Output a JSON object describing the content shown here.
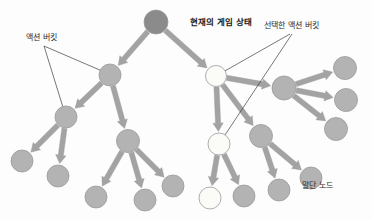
{
  "diagram": {
    "title_label": "현재의 게임 상태",
    "type": "tree",
    "canvas": {
      "width": 372,
      "height": 220,
      "background": "#fdfdfd"
    },
    "colors": {
      "root_node_fill": "#8b8b8b",
      "gray_node_fill": "#b3b3b3",
      "white_node_fill": "#fbfbf7",
      "node_stroke": "#9a9a9a",
      "edge_arrow": "#a3a3a3",
      "leader_line": "#3d3d3d",
      "label_text": "#2b2b2b"
    },
    "annotations": [
      {
        "id": "current-game-state",
        "text": "현재의 게임 상태",
        "x": 190,
        "y": 18,
        "bold": true,
        "leaders": []
      },
      {
        "id": "action-bucket",
        "text": "액션 버킷",
        "x": 26,
        "y": 34,
        "bold": false,
        "leaders": [
          {
            "x1": 44,
            "y1": 46,
            "x2": 109,
            "y2": 74
          },
          {
            "x1": 44,
            "y1": 46,
            "x2": 66,
            "y2": 117
          }
        ]
      },
      {
        "id": "selected-action-bucket",
        "text": "선택한 액션 버킷",
        "x": 264,
        "y": 22,
        "bold": false,
        "leaders": [
          {
            "x1": 290,
            "y1": 34,
            "x2": 216,
            "y2": 76
          },
          {
            "x1": 292,
            "y1": 34,
            "x2": 219,
            "y2": 144
          }
        ]
      },
      {
        "id": "leaf-node",
        "text": "말단 노드",
        "x": 302,
        "y": 182,
        "bold": false,
        "leaders": []
      }
    ],
    "nodes": [
      {
        "id": "root",
        "x": 156,
        "y": 22,
        "r": 12,
        "fill": "root",
        "name": "root-node-current-state"
      },
      {
        "id": "l1",
        "x": 110,
        "y": 75,
        "r": 11,
        "fill": "gray",
        "name": "tree-node-gray"
      },
      {
        "id": "r1",
        "x": 216,
        "y": 76,
        "r": 10.5,
        "fill": "white",
        "name": "tree-node-selected"
      },
      {
        "id": "l2a",
        "x": 66,
        "y": 117,
        "r": 11,
        "fill": "gray",
        "name": "tree-node-gray"
      },
      {
        "id": "l2b",
        "x": 128,
        "y": 141,
        "r": 11.5,
        "fill": "gray",
        "name": "tree-node-gray"
      },
      {
        "id": "r2a",
        "x": 219,
        "y": 144,
        "r": 11,
        "fill": "white",
        "name": "tree-node-selected"
      },
      {
        "id": "r2b",
        "x": 261,
        "y": 136,
        "r": 11.5,
        "fill": "gray",
        "name": "tree-node-gray"
      },
      {
        "id": "r1b",
        "x": 284,
        "y": 88,
        "r": 12,
        "fill": "gray",
        "name": "tree-node-gray"
      },
      {
        "id": "f1",
        "x": 22,
        "y": 161,
        "r": 11,
        "fill": "gray",
        "name": "tree-node-leaf"
      },
      {
        "id": "f2",
        "x": 58,
        "y": 176,
        "r": 11,
        "fill": "gray",
        "name": "tree-node-leaf"
      },
      {
        "id": "f3",
        "x": 96,
        "y": 197,
        "r": 11,
        "fill": "gray",
        "name": "tree-node-leaf"
      },
      {
        "id": "f4",
        "x": 145,
        "y": 200,
        "r": 11,
        "fill": "gray",
        "name": "tree-node-leaf"
      },
      {
        "id": "f5",
        "x": 173,
        "y": 186,
        "r": 11,
        "fill": "gray",
        "name": "tree-node-leaf"
      },
      {
        "id": "f6",
        "x": 210,
        "y": 198,
        "r": 11,
        "fill": "white",
        "name": "tree-node-leaf-selected"
      },
      {
        "id": "f7",
        "x": 244,
        "y": 196,
        "r": 11,
        "fill": "gray",
        "name": "tree-node-leaf"
      },
      {
        "id": "f8",
        "x": 279,
        "y": 190,
        "r": 11,
        "fill": "gray",
        "name": "tree-node-leaf"
      },
      {
        "id": "f9",
        "x": 311,
        "y": 178,
        "r": 11,
        "fill": "gray",
        "name": "tree-node-leaf"
      },
      {
        "id": "f10",
        "x": 345,
        "y": 68,
        "r": 11.5,
        "fill": "gray",
        "name": "tree-node-leaf"
      },
      {
        "id": "f11",
        "x": 346,
        "y": 100,
        "r": 11.5,
        "fill": "gray",
        "name": "tree-node-leaf"
      },
      {
        "id": "f12",
        "x": 336,
        "y": 129,
        "r": 11.5,
        "fill": "gray",
        "name": "tree-node-leaf"
      }
    ],
    "edges": [
      {
        "from": "root",
        "to": "l1"
      },
      {
        "from": "root",
        "to": "r1"
      },
      {
        "from": "l1",
        "to": "l2a"
      },
      {
        "from": "l1",
        "to": "l2b"
      },
      {
        "from": "l2a",
        "to": "f1"
      },
      {
        "from": "l2a",
        "to": "f2"
      },
      {
        "from": "l2b",
        "to": "f3"
      },
      {
        "from": "l2b",
        "to": "f4"
      },
      {
        "from": "l2b",
        "to": "f5"
      },
      {
        "from": "r1",
        "to": "r2a"
      },
      {
        "from": "r1",
        "to": "r2b"
      },
      {
        "from": "r1",
        "to": "r1b"
      },
      {
        "from": "r2a",
        "to": "f6"
      },
      {
        "from": "r2a",
        "to": "f7"
      },
      {
        "from": "r2b",
        "to": "f8"
      },
      {
        "from": "r2b",
        "to": "f9"
      },
      {
        "from": "r1b",
        "to": "f10"
      },
      {
        "from": "r1b",
        "to": "f11"
      },
      {
        "from": "r1b",
        "to": "f12"
      }
    ]
  }
}
